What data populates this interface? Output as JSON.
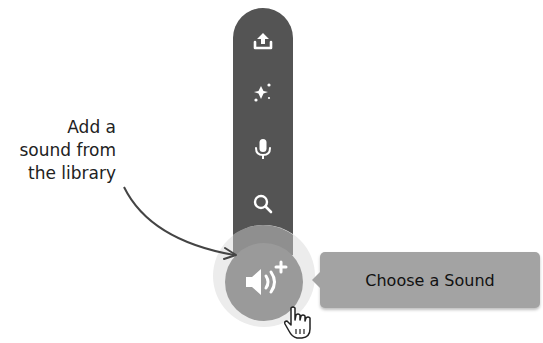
{
  "toolbar": {
    "items": [
      {
        "name": "upload-sound",
        "icon": "upload-icon"
      },
      {
        "name": "surprise",
        "icon": "sparkle-icon"
      },
      {
        "name": "record",
        "icon": "microphone-icon"
      },
      {
        "name": "choose-from-library",
        "icon": "search-icon"
      }
    ],
    "main_button": {
      "icon": "speaker-plus-icon"
    }
  },
  "tooltip": {
    "label": "Choose a Sound"
  },
  "annotation": {
    "lines": [
      "Add a",
      "sound from",
      "the library"
    ]
  },
  "colors": {
    "bar": "#545454",
    "main_button": "#9a9a9a",
    "tooltip": "#a3a3a3"
  }
}
